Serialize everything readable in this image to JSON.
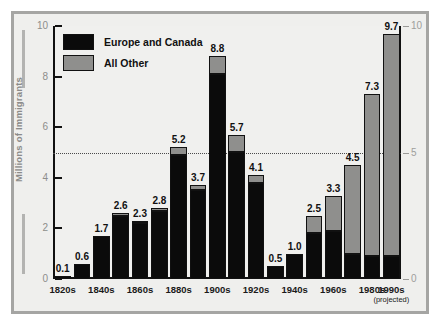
{
  "chart_data": {
    "type": "bar",
    "subtype": "stacked-bar",
    "title": "",
    "xlabel": "",
    "ylabel": "Millions of Immigrants",
    "ylim": [
      0,
      10
    ],
    "yticks": [
      0,
      2,
      4,
      6,
      8,
      10
    ],
    "yticks_right": [
      0,
      5,
      10
    ],
    "grid": false,
    "reference_line": 5,
    "legend_position": "top-left",
    "categories": [
      "1820s",
      "1830s",
      "1840s",
      "1850s",
      "1860s",
      "1870s",
      "1880s",
      "1890s",
      "1900s",
      "1910s",
      "1920s",
      "1930s",
      "1940s",
      "1950s",
      "1960s",
      "1970s",
      "1980s",
      "1990s"
    ],
    "tick_labels": [
      "1820s",
      "",
      "1840s",
      "",
      "1860s",
      "",
      "1880s",
      "",
      "1900s",
      "",
      "1920s",
      "",
      "1940s",
      "",
      "1960s",
      "",
      "1980s",
      "1990s"
    ],
    "last_tick_sublabel": "(projected)",
    "totals": [
      0.1,
      0.6,
      1.7,
      2.6,
      2.3,
      2.8,
      5.2,
      3.7,
      8.8,
      5.7,
      4.1,
      0.5,
      1.0,
      2.5,
      3.3,
      4.5,
      7.3,
      9.7
    ],
    "series": [
      {
        "name": "Europe and Canada",
        "color": "#0b0b0b",
        "values": [
          0.1,
          0.6,
          1.7,
          2.5,
          2.2,
          2.7,
          4.9,
          3.5,
          8.1,
          5.0,
          3.8,
          0.5,
          1.0,
          1.8,
          1.9,
          1.0,
          0.9,
          0.9
        ]
      },
      {
        "name": "All Other",
        "color": "#8f8f8d",
        "values": [
          0.0,
          0.0,
          0.0,
          0.1,
          0.1,
          0.1,
          0.3,
          0.2,
          0.7,
          0.7,
          0.3,
          0.0,
          0.0,
          0.7,
          1.4,
          3.5,
          6.4,
          8.8
        ]
      }
    ]
  },
  "legend": {
    "items": [
      {
        "label": "Europe and Canada",
        "swatch": "black-swatch"
      },
      {
        "label": "All Other",
        "swatch": "gray-swatch"
      }
    ]
  },
  "axes": {
    "y_left_label": "Millions of Immigrants",
    "y_left_ticks": [
      "10",
      "8",
      "6",
      "4",
      "2",
      "0"
    ],
    "y_right_ticks": [
      "10",
      "5",
      "0"
    ]
  },
  "colors": {
    "europe_canada": "#0b0b0b",
    "all_other": "#8f8f8d",
    "plot_background": "#f0f0ee",
    "frame_background": "#efefed",
    "frame_border": "#a5a5a3",
    "axis": "#111111",
    "tick_label": "#8d8d8b"
  }
}
